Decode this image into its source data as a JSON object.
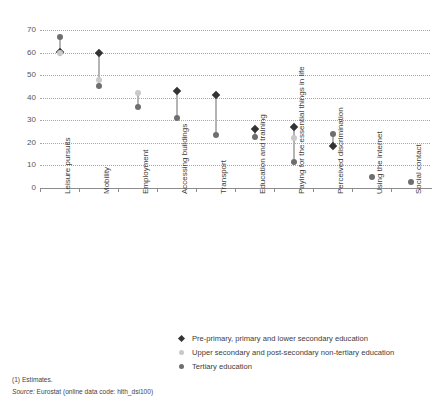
{
  "chart_data": {
    "type": "scatter",
    "title": "",
    "xlabel": "",
    "ylabel": "",
    "ylim": [
      0,
      70
    ],
    "yticks": [
      0,
      10,
      20,
      30,
      40,
      50,
      60,
      70
    ],
    "grid": true,
    "legend_position": "bottom",
    "categories": [
      "Leisure pursuits",
      "Mobility",
      "Employment",
      "Accessing buildings",
      "Transport",
      "Education and training",
      "Paying for the essential things in life",
      "Perceived discrimination",
      "Using the internet",
      "Social contact"
    ],
    "series": [
      {
        "name": "Pre-primary, primary and lower secondary education",
        "marker": "diamond",
        "color": "#333333",
        "values": [
          60.3,
          60.0,
          null,
          43.0,
          41.0,
          26.0,
          27.0,
          18.5,
          null,
          null
        ]
      },
      {
        "name": "Upper secondary and post-secondary non-tertiary education",
        "marker": "circle",
        "color": "#c9c9c9",
        "values": [
          60.0,
          48.0,
          42.0,
          null,
          null,
          null,
          22.0,
          null,
          null,
          null
        ]
      },
      {
        "name": "Tertiary education",
        "marker": "circle",
        "color": "#6e6e6e",
        "values": [
          67.0,
          45.3,
          36.0,
          31.0,
          23.5,
          22.5,
          11.5,
          24.0,
          5.0,
          2.5
        ]
      }
    ]
  },
  "footnotes": {
    "estimates": "(1) Estimates.",
    "source_prefix": "Source:",
    "source_text": " Eurostat (online data code: hlth_dsi100)"
  }
}
